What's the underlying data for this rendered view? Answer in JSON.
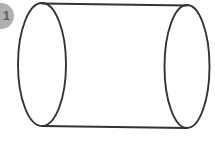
{
  "figure": {
    "name": "cylinder",
    "caption": "",
    "background_color": "#ffffff",
    "stroke_color": "#333333",
    "fill_color": "none",
    "stroke_width": 1.9
  },
  "marker": {
    "label": "1",
    "shape": "circle",
    "fill_color": "#b0b0b0",
    "text_color": "#555f66",
    "clipped": "left"
  },
  "chart_data": {
    "type": "diagram",
    "title": "",
    "subtitle": "",
    "xlabel": "",
    "ylabel": "",
    "shape": "cylinder",
    "orientation": "horizontal",
    "grid": false,
    "legend": "none",
    "annotations": [],
    "elements": [
      {
        "name": "left-base-ellipse",
        "type": "ellipse",
        "cx": 42,
        "cy": 64.5,
        "rx": 24,
        "ry": 61.5,
        "stroke": "#333333",
        "fill": "none"
      },
      {
        "name": "right-base-ellipse",
        "type": "ellipse",
        "cx": 187,
        "cy": 66.5,
        "rx": 22.5,
        "ry": 61.5,
        "stroke": "#333333",
        "fill": "none"
      },
      {
        "name": "top-side-line",
        "type": "line",
        "x1": 42,
        "y1": 3.5,
        "x2": 187,
        "y2": 5.5,
        "stroke": "#333333"
      },
      {
        "name": "bottom-side-line",
        "type": "line",
        "x1": 42,
        "y1": 126,
        "x2": 187,
        "y2": 128,
        "stroke": "#333333"
      },
      {
        "name": "marker-circle",
        "type": "circle",
        "cx": 1,
        "cy": 16,
        "r": 13,
        "stroke": "none",
        "fill": "#b0b0b0"
      }
    ]
  }
}
